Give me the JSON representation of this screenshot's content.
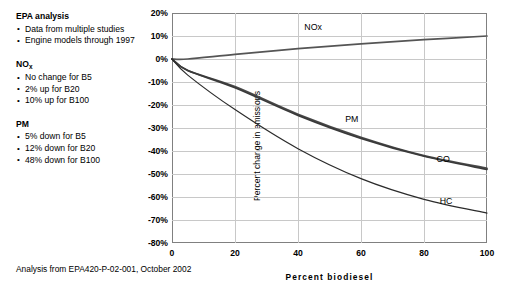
{
  "sidebar": {
    "groups": [
      {
        "heading": "EPA analysis",
        "heading_sub": "",
        "bullets": [
          "Data from multiple studies",
          "Engine models through 1997"
        ]
      },
      {
        "heading": "NO",
        "heading_sub": "x",
        "bullets": [
          "No change for B5",
          "2% up for B20",
          "10% up for B100"
        ]
      },
      {
        "heading": "PM",
        "heading_sub": "",
        "bullets": [
          "5% down for B5",
          "12% down for B20",
          "48% down for B100"
        ]
      }
    ]
  },
  "footer": {
    "source": "Analysis from EPA420-P-02-001, October 2002"
  },
  "chart_data": {
    "type": "line",
    "title": "",
    "xlabel": "Percent biodiesel",
    "ylabel": "Percent change in emissions",
    "xlim": [
      0,
      100
    ],
    "ylim": [
      -80,
      20
    ],
    "xticks": [
      0,
      20,
      40,
      60,
      80,
      100
    ],
    "yticks": [
      "20%",
      "10%",
      "0%",
      "-10%",
      "-20%",
      "-30%",
      "-40%",
      "-50%",
      "-60%",
      "-70%",
      "-80%"
    ],
    "ytick_values": [
      20,
      10,
      0,
      -10,
      -20,
      -30,
      -40,
      -50,
      -60,
      -70,
      -80
    ],
    "grid": true,
    "legend_position": "inline-labels",
    "x": [
      0,
      5,
      20,
      40,
      60,
      80,
      100
    ],
    "series": [
      {
        "name": "NOx",
        "label": "NOx",
        "color": "#555555",
        "values": [
          0,
          0,
          2,
          4.5,
          6.6,
          8.4,
          10
        ]
      },
      {
        "name": "PM",
        "label": "PM",
        "color": "#4a4a4a",
        "values": [
          0,
          -5,
          -12,
          -24,
          -34,
          -42,
          -47.5
        ]
      },
      {
        "name": "CO",
        "label": "CO",
        "color": "#3a3a3a",
        "values": [
          0,
          -5,
          -12.5,
          -24.5,
          -34.5,
          -42.3,
          -48
        ]
      },
      {
        "name": "HC",
        "label": "HC",
        "color": "#2b2b2b",
        "values": [
          0,
          -7,
          -22,
          -39,
          -52,
          -61,
          -67
        ]
      }
    ],
    "annotations": [
      {
        "text": "NOx",
        "x": 42,
        "y": 13.5
      },
      {
        "text": "PM",
        "x": 55,
        "y": -26.5
      },
      {
        "text": "CO",
        "x": 84,
        "y": -44
      },
      {
        "text": "HC",
        "x": 85,
        "y": -62
      }
    ]
  }
}
